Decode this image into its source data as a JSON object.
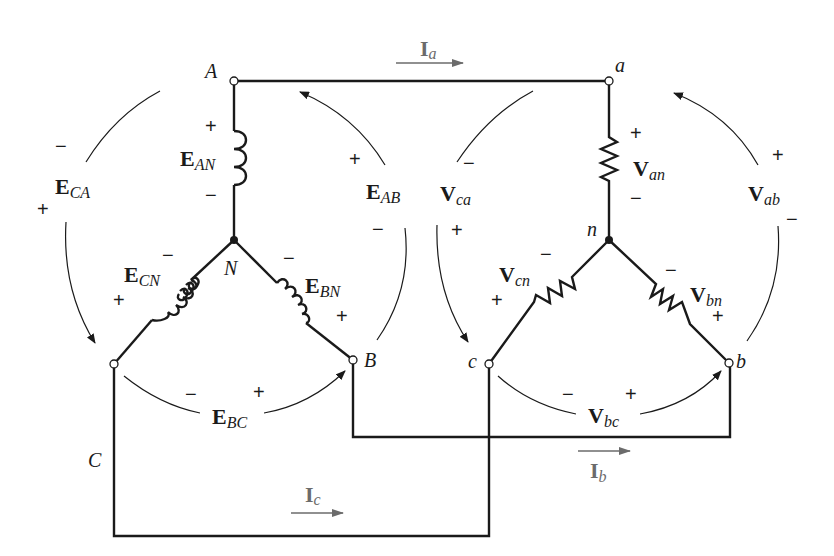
{
  "diagram": {
    "source": {
      "nodes": {
        "A": "A",
        "B": "B",
        "C": "C",
        "N": "N"
      },
      "phase_voltages": [
        {
          "main": "E",
          "sub": "AN",
          "plus": "+",
          "minus": "−"
        },
        {
          "main": "E",
          "sub": "BN",
          "plus": "+",
          "minus": "−"
        },
        {
          "main": "E",
          "sub": "CN",
          "plus": "+",
          "minus": "−"
        }
      ],
      "line_voltages": [
        {
          "main": "E",
          "sub": "AB",
          "plus": "+",
          "minus": "−"
        },
        {
          "main": "E",
          "sub": "BC",
          "plus": "+",
          "minus": "−"
        },
        {
          "main": "E",
          "sub": "CA",
          "plus": "+",
          "minus": "−"
        }
      ]
    },
    "load": {
      "nodes": {
        "a": "a",
        "b": "b",
        "c": "c",
        "n": "n"
      },
      "phase_voltages": [
        {
          "main": "V",
          "sub": "an",
          "plus": "+",
          "minus": "−"
        },
        {
          "main": "V",
          "sub": "bn",
          "plus": "+",
          "minus": "−"
        },
        {
          "main": "V",
          "sub": "cn",
          "plus": "+",
          "minus": "−"
        }
      ],
      "line_voltages": [
        {
          "main": "V",
          "sub": "ab",
          "plus": "+",
          "minus": "−"
        },
        {
          "main": "V",
          "sub": "bc",
          "plus": "+",
          "minus": "−"
        },
        {
          "main": "V",
          "sub": "ca",
          "plus": "+",
          "minus": "−"
        }
      ]
    },
    "currents": [
      {
        "main": "I",
        "sub": "a"
      },
      {
        "main": "I",
        "sub": "b"
      },
      {
        "main": "I",
        "sub": "c"
      }
    ],
    "colors": {
      "wire": "#1a1a1a",
      "current": "#6b6b6b",
      "background": "#ffffff"
    }
  }
}
